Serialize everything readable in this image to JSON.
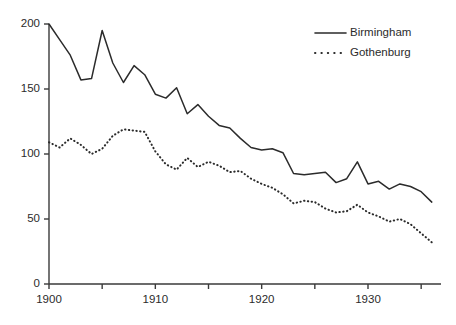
{
  "chart_data": {
    "type": "line",
    "title": "",
    "subtitle": "",
    "xlabel": "",
    "ylabel": "",
    "xlim": [
      1899,
      1937
    ],
    "ylim": [
      0,
      205
    ],
    "grid": false,
    "legend_position": "top-right",
    "y_ticks": [
      0,
      50,
      100,
      150,
      200
    ],
    "y_tick_labels": [
      "0",
      "50",
      "100",
      "150",
      "200"
    ],
    "x_ticks": [
      1900,
      1905,
      1910,
      1915,
      1920,
      1925,
      1930,
      1935
    ],
    "x_tick_labels": [
      "1900",
      "",
      "1910",
      "",
      "1920",
      "",
      "1930",
      ""
    ],
    "x_major_labeled": [
      1900,
      1910,
      1920,
      1930
    ],
    "x": [
      1900,
      1901,
      1902,
      1903,
      1904,
      1905,
      1906,
      1907,
      1908,
      1909,
      1910,
      1911,
      1912,
      1913,
      1914,
      1915,
      1916,
      1917,
      1918,
      1919,
      1920,
      1921,
      1922,
      1923,
      1924,
      1925,
      1926,
      1927,
      1928,
      1929,
      1930,
      1931,
      1932,
      1933,
      1934,
      1935,
      1936
    ],
    "series": [
      {
        "name": "Birmingham",
        "style": "solid",
        "color": "#2b2b2b",
        "values": [
          200,
          188,
          176,
          157,
          158,
          195,
          170,
          155,
          168,
          161,
          146,
          143,
          151,
          131,
          138,
          129,
          122,
          120,
          112,
          105,
          103,
          104,
          101,
          85,
          84,
          85,
          86,
          78,
          81,
          94,
          77,
          79,
          73,
          77,
          75,
          71,
          63
        ]
      },
      {
        "name": "Gothenburg",
        "style": "dotted",
        "color": "#2b2b2b",
        "values": [
          109,
          105,
          112,
          107,
          100,
          104,
          114,
          119,
          118,
          117,
          102,
          92,
          88,
          97,
          90,
          94,
          91,
          86,
          87,
          81,
          77,
          74,
          69,
          62,
          64,
          63,
          58,
          55,
          56,
          61,
          55,
          52,
          48,
          50,
          46,
          39,
          32
        ]
      }
    ],
    "legend": [
      {
        "label": "Birmingham",
        "style": "solid"
      },
      {
        "label": "Gothenburg",
        "style": "dotted"
      }
    ],
    "axis_color": "#3a3a3a"
  }
}
